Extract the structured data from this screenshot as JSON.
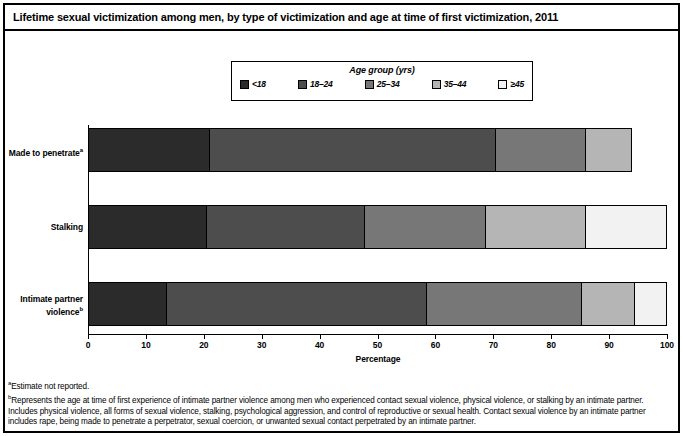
{
  "title": "Lifetime sexual victimization among men, by type of victimization and age at time of first victimization, 2011",
  "legend": {
    "title": "Age group (yrs)",
    "items": [
      {
        "label": "<18",
        "color": "#2b2b2b"
      },
      {
        "label": "18–24",
        "color": "#4d4d4d"
      },
      {
        "label": "25–34",
        "color": "#777777"
      },
      {
        "label": "35–44",
        "color": "#b5b5b5"
      },
      {
        "label": "≥45",
        "color": "#f2f2f2"
      }
    ]
  },
  "chart_data": {
    "type": "bar",
    "orientation": "horizontal",
    "stacked": true,
    "title": "Lifetime sexual victimization among men, by type of victimization and age at time of first victimization, 2011",
    "xlabel": "Percentage",
    "ylabel": "",
    "xlim": [
      0,
      100
    ],
    "xticks": [
      0,
      10,
      20,
      30,
      40,
      50,
      60,
      70,
      80,
      90,
      100
    ],
    "grid": false,
    "legend_position": "top-center",
    "categories": [
      "Made to penetrateᵃ",
      "Stalking",
      "Intimate partner violenceᵇ"
    ],
    "category_lines": [
      [
        "Made to penetrate",
        "a"
      ],
      [
        "Stalking",
        ""
      ],
      [
        "Intimate partner",
        "violence",
        "b"
      ]
    ],
    "series": [
      {
        "name": "<18",
        "color": "#2b2b2b",
        "values": [
          21.0,
          20.5,
          13.7
        ]
      },
      {
        "name": "18–24",
        "color": "#4d4d4d",
        "values": [
          49.5,
          27.3,
          44.8
        ]
      },
      {
        "name": "25–34",
        "color": "#777777",
        "values": [
          15.5,
          21.0,
          26.8
        ]
      },
      {
        "name": "35–44",
        "color": "#b5b5b5",
        "values": [
          8.0,
          17.2,
          9.2
        ]
      },
      {
        "name": "≥45",
        "color": "#f2f2f2",
        "values": [
          0.0,
          14.0,
          5.5
        ]
      }
    ],
    "totals": [
      94.0,
      100.0,
      100.0
    ]
  },
  "footnotes": [
    {
      "marker": "a",
      "text": "Estimate not reported."
    },
    {
      "marker": "b",
      "text": "Represents the age at time of first experience of intimate partner violence among men who experienced contact sexual violence, physical violence, or stalking by an intimate partner. Includes physical violence, all forms of sexual violence, stalking, psychological aggression, and control of reproductive or sexual health. Contact sexual violence by an intimate partner includes rape, being made to penetrate a perpetrator, sexual coercion, or unwanted sexual contact perpetrated by an intimate partner."
    }
  ]
}
